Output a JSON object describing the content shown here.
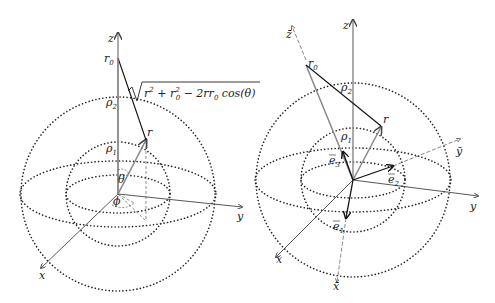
{
  "left_panel": {
    "axes": {
      "x": "x",
      "y": "y",
      "z": "z"
    },
    "points": {
      "r0": "r",
      "r0_sub": "0",
      "r": "r"
    },
    "radii": {
      "rho1": "ρ",
      "rho1_sub": "1",
      "rho2": "ρ",
      "rho2_sub": "2"
    },
    "angles": {
      "theta": "θ",
      "phi": "ϕ"
    },
    "formula": {
      "prefix": "r",
      "sq1": "2",
      "plus": " + r",
      "sq2": "2",
      "sub2": "0",
      "minus": " − 2rr",
      "sub3": "0",
      "tail": " cos(θ)"
    }
  },
  "right_panel": {
    "axes": {
      "x": "x",
      "y": "y",
      "z": "z",
      "x_bar": "x̄",
      "y_bar": "ȳ",
      "z_bar": "z̄"
    },
    "points": {
      "r0": "r",
      "r0_sub": "0",
      "r": "r"
    },
    "radii": {
      "rho1": "ρ",
      "rho1_sub": "1",
      "rho2": "ρ",
      "rho2_sub": "2"
    },
    "basis": {
      "e1": "e",
      "e1_sub": "1",
      "e2": "e",
      "e2_sub": "2",
      "e3": "e",
      "e3_sub": "3"
    }
  },
  "colors": {
    "axis": "#555555",
    "dots": "#222222",
    "vector": "#111111",
    "gray_vector": "#888888"
  }
}
